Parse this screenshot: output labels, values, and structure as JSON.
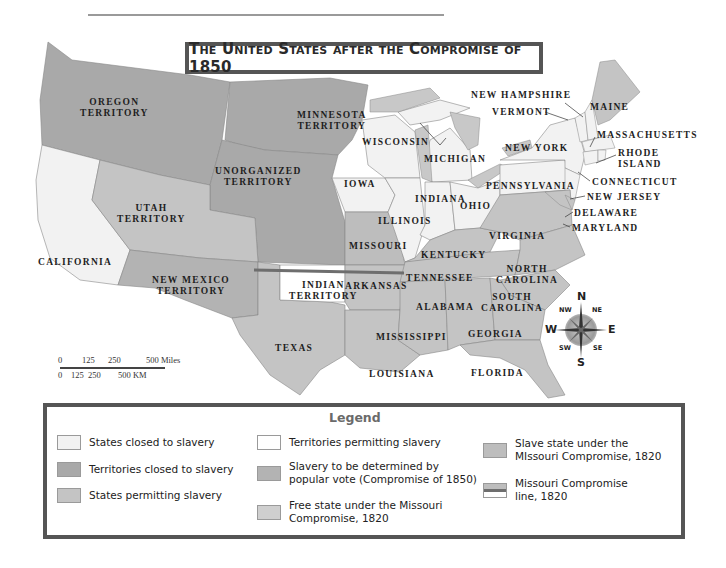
{
  "title": "The United States after the Compromise of 1850",
  "colors": {
    "states_closed": "#f2f2f2",
    "territories_closed": "#a9a9a9",
    "states_permitting": "#c4c4c4",
    "territories_permitting": "#ffffff",
    "popular_vote": "#b3b3b3",
    "free_state_mc": "#cfcfcf",
    "slave_state_mc": "#bdbdbd",
    "compromise_line": "#6e6e6e",
    "ocean": "#ffffff"
  },
  "labels": {
    "oregon": [
      "OREGON",
      "TERRITORY"
    ],
    "minnesota": [
      "MINNESOTA",
      "TERRITORY"
    ],
    "unorganized": [
      "UNORGANIZED",
      "TERRITORY"
    ],
    "utah": [
      "UTAH",
      "TERRITORY"
    ],
    "california": "CALIFORNIA",
    "new_mexico": [
      "NEW MEXICO",
      "TERRITORY"
    ],
    "texas": "TEXAS",
    "indian": [
      "INDIAN",
      "TERRITORY"
    ],
    "iowa": "IOWA",
    "missouri": "MISSOURI",
    "arkansas": "ARKANSAS",
    "louisiana": "LOUISIANA",
    "wisconsin": "WISCONSIN",
    "michigan": "MICHIGAN",
    "illinois": "ILLINOIS",
    "indiana": "INDIANA",
    "ohio": "OHIO",
    "kentucky": "KENTUCKY",
    "tennessee": "TENNESSEE",
    "mississippi": "MISSISSIPPI",
    "alabama": "ALABAMA",
    "georgia": "GEORGIA",
    "florida": "FLORIDA",
    "south_carolina": [
      "SOUTH",
      "CAROLINA"
    ],
    "north_carolina": [
      "NORTH",
      "CAROLINA"
    ],
    "virginia": "VIRGINIA",
    "pennsylvania": "PENNSYLVANIA",
    "new_york": "NEW YORK",
    "vermont": "VERMONT",
    "new_hampshire": "NEW HAMPSHIRE",
    "maine": "MAINE",
    "massachusetts": "MASSACHUSETTS",
    "rhode_island": [
      "RHODE",
      "ISLAND"
    ],
    "connecticut": "CONNECTICUT",
    "new_jersey": "NEW JERSEY",
    "delaware": "DELAWARE",
    "maryland": "MARYLAND"
  },
  "scale": {
    "miles_ticks": [
      "0",
      "125",
      "250",
      "500 Miles"
    ],
    "km_ticks": [
      "0",
      "125",
      "250",
      "500 KM"
    ]
  },
  "compass": {
    "n": "N",
    "s": "S",
    "e": "E",
    "w": "W",
    "ne": "NE",
    "nw": "NW",
    "se": "SE",
    "sw": "SW"
  },
  "legend": {
    "title": "Legend",
    "items": [
      {
        "label": "States closed to slavery"
      },
      {
        "label": "Territories closed to slavery"
      },
      {
        "label": "States permitting slavery"
      },
      {
        "label": "Territories permitting slavery"
      },
      {
        "label_1": "Slavery to be determined by",
        "label_2": "popular vote (Compromise of 1850)"
      },
      {
        "label_1": "Free state under the Missouri",
        "label_2": "Compromise, 1820"
      },
      {
        "label_1": "Slave state under the",
        "label_2": "MIssouri Compromise, 1820"
      },
      {
        "label_1": "Missouri Compromise",
        "label_2": "line, 1820"
      }
    ]
  }
}
